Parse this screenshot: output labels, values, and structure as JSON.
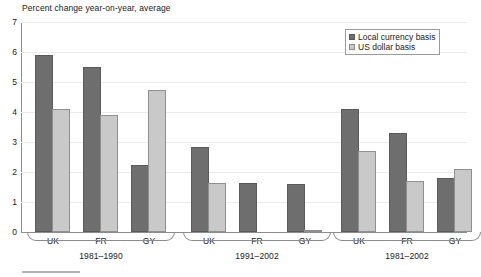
{
  "chart_data": {
    "type": "bar",
    "title": "Percent change year-on-year, average",
    "xlabel": "",
    "ylabel": "",
    "ylim": [
      0,
      7
    ],
    "yticks": [
      0,
      1,
      2,
      3,
      4,
      5,
      6,
      7
    ],
    "ytick_labels": [
      "0",
      "1",
      "2",
      "3",
      "4",
      "5",
      "6",
      "7"
    ],
    "grid": true,
    "legend_position": "top-right",
    "categories": [
      "UK",
      "FR",
      "GY"
    ],
    "groups": [
      {
        "label": "1981–1990",
        "categories": [
          "UK",
          "FR",
          "GY"
        ],
        "series": [
          {
            "name": "Local currency basis",
            "values": [
              5.9,
              5.5,
              2.25
            ]
          },
          {
            "name": "US dollar basis",
            "values": [
              4.1,
              3.9,
              4.75
            ]
          }
        ]
      },
      {
        "label": "1991–2002",
        "categories": [
          "UK",
          "FR",
          "GY"
        ],
        "series": [
          {
            "name": "Local currency basis",
            "values": [
              2.85,
              1.62,
              1.6
            ]
          },
          {
            "name": "US dollar basis",
            "values": [
              1.65,
              0,
              0.07
            ]
          }
        ]
      },
      {
        "label": "1981–2002",
        "categories": [
          "UK",
          "FR",
          "GY"
        ],
        "series": [
          {
            "name": "Local currency basis",
            "values": [
              4.1,
              3.3,
              1.8
            ]
          },
          {
            "name": "US dollar basis",
            "values": [
              2.7,
              1.7,
              2.1
            ]
          }
        ]
      }
    ],
    "series_names": [
      "Local currency basis",
      "US dollar basis"
    ],
    "series_colors": [
      "#6e6e6e",
      "#c9c9c9"
    ]
  },
  "legend": {
    "entries": [
      {
        "label": "Local currency basis",
        "color": "#6e6e6e",
        "swatch": "legend-swatch-dark"
      },
      {
        "label": "US dollar basis",
        "color": "#c9c9c9",
        "swatch": "legend-swatch-light"
      }
    ]
  },
  "colors": {
    "local_currency": "#6e6e6e",
    "us_dollar": "#c9c9c9",
    "axis": "#8c8c8c",
    "gridline": "#ebebeb",
    "text": "#1a1a1a"
  }
}
